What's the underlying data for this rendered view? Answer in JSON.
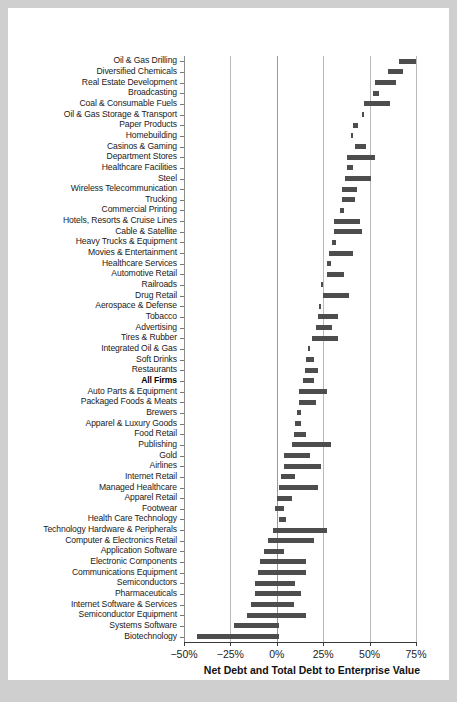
{
  "chart_data": {
    "type": "bar",
    "orientation": "horizontal",
    "subtype": "floating-range",
    "title": "",
    "xlabel": "Net Debt and Total Debt to Enterprise Value",
    "ylabel": "",
    "xlim": [
      -50,
      75
    ],
    "xticks": [
      -50,
      -25,
      0,
      25,
      50,
      75
    ],
    "xticklabels": [
      "−50%",
      "−25%",
      "0%",
      "25%",
      "50%",
      "75%"
    ],
    "grid": true,
    "legend": null,
    "highlight_category": "All Firms",
    "bar_color": "#4d4d4d",
    "value_unit": "percent",
    "value_note": "Each bar spans from Net Debt / Enterprise Value (left end) to Total Debt / Enterprise Value (right end)",
    "categories": [
      "Oil & Gas Drilling",
      "Diversified Chemicals",
      "Real Estate Development",
      "Broadcasting",
      "Coal & Consumable Fuels",
      "Oil & Gas Storage & Transport",
      "Paper Products",
      "Homebuilding",
      "Casinos & Gaming",
      "Department Stores",
      "Healthcare Facilities",
      "Steel",
      "Wireless Telecommunication",
      "Trucking",
      "Commercial Printing",
      "Hotels, Resorts & Cruise Lines",
      "Cable & Satellite",
      "Heavy Trucks & Equipment",
      "Movies & Entertainment",
      "Healthcare Services",
      "Automotive Retail",
      "Railroads",
      "Drug Retail",
      "Aerospace & Defense",
      "Tobacco",
      "Advertising",
      "Tires & Rubber",
      "Integrated Oil & Gas",
      "Soft Drinks",
      "Restaurants",
      "All Firms",
      "Auto Parts & Equipment",
      "Packaged Foods & Meats",
      "Brewers",
      "Apparel & Luxury Goods",
      "Food Retail",
      "Publishing",
      "Gold",
      "Airlines",
      "Internet Retail",
      "Managed Healthcare",
      "Apparel Retail",
      "Footwear",
      "Health Care Technology",
      "Technology Hardware & Peripherals",
      "Computer & Electronics Retail",
      "Application Software",
      "Electronic Components",
      "Communications Equipment",
      "Semiconductors",
      "Pharmaceuticals",
      "Internet Software & Services",
      "Semiconductor Equipment",
      "Systems Software",
      "Biotechnology"
    ],
    "net_debt_to_ev": [
      66,
      60,
      53,
      52,
      47,
      46,
      41,
      40,
      42,
      38,
      38,
      37,
      35,
      35,
      34,
      31,
      31,
      30,
      28,
      27,
      27,
      24,
      25,
      23,
      22,
      21,
      19,
      17,
      16,
      15,
      14,
      12,
      12,
      11,
      10,
      9,
      8,
      4,
      4,
      2,
      1,
      0,
      -1,
      1,
      -2,
      -5,
      -7,
      -9,
      -10,
      -12,
      -12,
      -14,
      -16,
      -23,
      -43
    ],
    "total_debt_to_ev": [
      75,
      68,
      64,
      55,
      61,
      47,
      44,
      41,
      48,
      53,
      41,
      51,
      43,
      42,
      36,
      45,
      46,
      32,
      41,
      29,
      36,
      24,
      39,
      24,
      33,
      30,
      33,
      18,
      20,
      22,
      20,
      27,
      21,
      13,
      13,
      16,
      29,
      18,
      24,
      10,
      22,
      8,
      4,
      5,
      27,
      20,
      4,
      16,
      16,
      10,
      13,
      9,
      16,
      1,
      1
    ]
  },
  "axis": {
    "x_tick_labels": [
      "−50%",
      "−25%",
      "0%",
      "25%",
      "50%",
      "75%"
    ],
    "x_title": "Net Debt and Total Debt to Enterprise Value"
  }
}
